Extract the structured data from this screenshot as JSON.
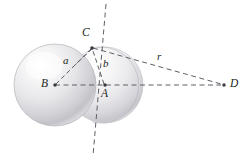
{
  "figure": {
    "background_color": "#ffffff",
    "line_color": "#5f5f68",
    "label_color": "#231f20",
    "sphere_fill_light": "#ffffff",
    "sphere_fill_mid": "#e3e3e6",
    "sphere_fill_dark": "#b9b9bf",
    "sphere_edge": "#a8a8ae"
  },
  "points": [
    {
      "id": "B",
      "label": "B",
      "x": 55,
      "y": 85,
      "role": "center-large-sphere",
      "dot": true
    },
    {
      "id": "A",
      "label": "A",
      "x": 105,
      "y": 85,
      "role": "center-small-sphere",
      "dot": true
    },
    {
      "id": "C",
      "label": "C",
      "x": 92,
      "y": 48,
      "role": "sphere-intersection",
      "dot": true
    },
    {
      "id": "D",
      "label": "D",
      "x": 224,
      "y": 85,
      "role": "external-point",
      "dot": true
    }
  ],
  "segments": [
    {
      "id": "BC",
      "label": "a",
      "from": "B",
      "to": "C",
      "style": "dashed"
    },
    {
      "id": "AC",
      "label": "b",
      "from": "A",
      "to": "C",
      "style": "dashed"
    },
    {
      "id": "CD",
      "label": "r",
      "from": "C",
      "to": "D",
      "style": "dashed"
    },
    {
      "id": "BD",
      "label": "",
      "from": "B",
      "to": "D",
      "style": "dashed"
    }
  ],
  "extra_lines": [
    {
      "id": "radical-axis",
      "style": "dashed",
      "x1": 106,
      "y1": 4,
      "x2": 93,
      "y2": 156
    }
  ],
  "spheres": [
    {
      "id": "large-sphere",
      "center": "B",
      "cx": 55,
      "cy": 85,
      "r": 41
    },
    {
      "id": "small-sphere",
      "center": "A",
      "cx": 105,
      "cy": 85,
      "r": 38
    }
  ],
  "labels": {
    "B": "B",
    "A": "A",
    "C": "C",
    "D": "D",
    "a": "a",
    "b": "b",
    "r": "r"
  },
  "label_positions": {
    "B": {
      "x": 41,
      "y": 78
    },
    "A": {
      "x": 101,
      "y": 88
    },
    "C": {
      "x": 82,
      "y": 27
    },
    "D": {
      "x": 230,
      "y": 78
    },
    "a": {
      "x": 63,
      "y": 55
    },
    "b": {
      "x": 103,
      "y": 58
    },
    "r": {
      "x": 157,
      "y": 51
    }
  }
}
